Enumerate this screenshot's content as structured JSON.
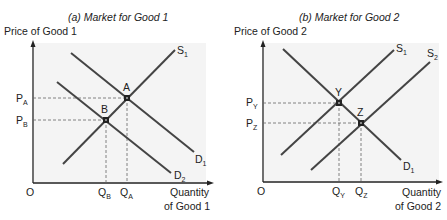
{
  "panels": [
    {
      "id": "a",
      "title": "(a) Market for Good 1",
      "y_axis_label": "Price of Good 1",
      "x_axis_label_line1": "Quantity",
      "x_axis_label_line2": "of Good 1",
      "origin_label": "O",
      "curves": [
        {
          "name": "S",
          "sub": "1",
          "x1": 63,
          "y1": 164,
          "x2": 175,
          "y2": 50
        },
        {
          "name": "D",
          "sub": "1",
          "x1": 71,
          "y1": 53,
          "x2": 194,
          "y2": 152
        },
        {
          "name": "D",
          "sub": "2",
          "x1": 57,
          "y1": 82,
          "x2": 171,
          "y2": 173
        }
      ],
      "points": [
        {
          "label": "A",
          "x": 127,
          "y": 98,
          "price_label": "P",
          "price_sub": "A",
          "qty_label": "Q",
          "qty_sub": "A"
        },
        {
          "label": "B",
          "x": 106,
          "y": 120,
          "price_label": "P",
          "price_sub": "B",
          "qty_label": "Q",
          "qty_sub": "B"
        }
      ]
    },
    {
      "id": "b",
      "title": "(b) Market for Good 2",
      "y_axis_label": "Price of Good 2",
      "x_axis_label_line1": "Quantity",
      "x_axis_label_line2": "of Good 2",
      "origin_label": "O",
      "curves": [
        {
          "name": "S",
          "sub": "1",
          "x1": 281,
          "y1": 155,
          "x2": 394,
          "y2": 50
        },
        {
          "name": "S",
          "sub": "2",
          "x1": 311,
          "y1": 170,
          "x2": 430,
          "y2": 62
        },
        {
          "name": "D",
          "sub": "1",
          "x1": 283,
          "y1": 49,
          "x2": 401,
          "y2": 160
        }
      ],
      "points": [
        {
          "label": "Y",
          "x": 339,
          "y": 103,
          "price_label": "P",
          "price_sub": "Y",
          "qty_label": "Q",
          "qty_sub": "Y"
        },
        {
          "label": "Z",
          "x": 361,
          "y": 123,
          "price_label": "P",
          "price_sub": "Z",
          "qty_label": "Q",
          "qty_sub": "Z"
        }
      ]
    }
  ]
}
